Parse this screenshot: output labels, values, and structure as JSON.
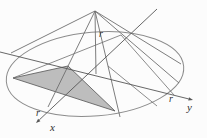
{
  "colors": {
    "background": "#fcfcfc",
    "line": "#6e6e6e",
    "axis": "#565656",
    "ellipse": "#8c8c8c",
    "triangle_fill": "#bdbdbd",
    "triangle_edge": "#636363",
    "label": "#2f2f2f"
  },
  "labels": [
    {
      "id": "r-top",
      "text": "r",
      "x": 99,
      "y": 37,
      "size": 10
    },
    {
      "id": "r-left",
      "text": "r",
      "x": 36,
      "y": 116,
      "size": 10
    },
    {
      "id": "r-right",
      "text": "r",
      "x": 169,
      "y": 102,
      "size": 10
    },
    {
      "id": "x-axis",
      "text": "x",
      "x": 50,
      "y": 131,
      "size": 11
    },
    {
      "id": "y-axis",
      "text": "y",
      "x": 187,
      "y": 111,
      "size": 11
    }
  ],
  "figure": {
    "ellipse": {
      "cx": 95,
      "cy": 74,
      "rx": 89,
      "ry": 42,
      "rotate": -5
    },
    "apex": {
      "x": 95,
      "y": 11
    },
    "rays": [
      {
        "id": "left-silhouette",
        "pts": [
          95,
          11,
          11,
          53
        ]
      },
      {
        "id": "left-slant-through-cut",
        "pts": [
          95,
          11,
          48,
          107
        ]
      },
      {
        "id": "vertical-height",
        "pts": [
          95,
          11,
          96,
          74
        ]
      },
      {
        "id": "right-steep-slant",
        "pts": [
          95,
          11,
          120,
          117
        ]
      },
      {
        "id": "right-mid-slant",
        "pts": [
          95,
          11,
          179,
          83
        ]
      },
      {
        "id": "right-silhouette",
        "pts": [
          95,
          11,
          181,
          64
        ]
      }
    ],
    "axes": [
      {
        "id": "x",
        "x1": 157,
        "y1": 9,
        "x2": 36,
        "y2": 123
      },
      {
        "id": "y",
        "x1": 0,
        "y1": 52,
        "x2": 193,
        "y2": 100
      }
    ],
    "chords": [
      {
        "id": "back-diameter-chord",
        "pts": [
          13,
          78,
          121,
          35
        ]
      },
      {
        "id": "right-section-edge",
        "pts": [
          108,
          66,
          157,
          106
        ]
      },
      {
        "id": "right-section-base",
        "pts": [
          121,
          35,
          174,
          95
        ]
      }
    ],
    "triangle": [
      [
        13,
        78
      ],
      [
        68,
        66
      ],
      [
        115,
        111
      ]
    ]
  }
}
